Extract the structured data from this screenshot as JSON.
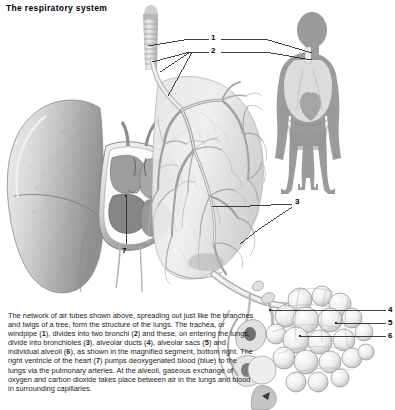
{
  "figure": {
    "title": "The respiratory system",
    "type": "anatomical-illustration",
    "palette": {
      "background": "#ffffff",
      "text": "#111111",
      "leader_line": "#2b2b2b",
      "organ_light": "#f2f2f2",
      "organ_mid": "#c9c9c9",
      "organ_dark": "#8e8e8e",
      "body_silhouette": "#9a9a9a",
      "body_lung": "#d8d8d8"
    }
  },
  "labels": [
    {
      "id": "1",
      "text": "1",
      "refers_to": "trachea-windpipe",
      "x": 214,
      "y": 38
    },
    {
      "id": "2",
      "text": "2",
      "refers_to": "bronchi",
      "x": 214,
      "y": 51
    },
    {
      "id": "3",
      "text": "3",
      "refers_to": "bronchioles",
      "x": 298,
      "y": 202
    },
    {
      "id": "4",
      "text": "4",
      "refers_to": "alveolar-ducts",
      "x": 390,
      "y": 309
    },
    {
      "id": "5",
      "text": "5",
      "refers_to": "alveolar-sacs",
      "x": 390,
      "y": 322
    },
    {
      "id": "6",
      "text": "6",
      "refers_to": "individual-alveoli",
      "x": 390,
      "y": 334
    },
    {
      "id": "7",
      "text": "7",
      "refers_to": "right-ventricle-of-heart",
      "x": 124,
      "y": 251
    }
  ],
  "parts": [
    {
      "name": "left-lung",
      "description": "Left lung, external surface, shaded grey"
    },
    {
      "name": "right-lung-bronchial-tree",
      "description": "Right lung sectioned to reveal branching bronchial tree"
    },
    {
      "name": "trachea",
      "description": "Trachea with cartilage rings at top centre"
    },
    {
      "name": "heart-cross-section",
      "description": "Cut-away of the heart showing chambers and valves"
    },
    {
      "name": "body-silhouette-inset",
      "description": "Grey human figure inset showing lungs in situ"
    },
    {
      "name": "alveoli-cluster",
      "description": "Magnified cluster of alveolar sacs, bottom right"
    }
  ],
  "caption": {
    "segments": [
      {
        "t": "The network of air tubes shown above, spreading out just like the branches and twigs of a tree, form the structure of the lungs. The trachea, or windpipe (",
        "b": false
      },
      {
        "t": "1",
        "b": true
      },
      {
        "t": "), divides into two bronchi (",
        "b": false
      },
      {
        "t": "2",
        "b": true
      },
      {
        "t": ") and these, on entering the lungs, divide into bronchioles (",
        "b": false
      },
      {
        "t": "3",
        "b": true
      },
      {
        "t": "), alveolar ducts (",
        "b": false
      },
      {
        "t": "4",
        "b": true
      },
      {
        "t": "), alveolar sacs (",
        "b": false
      },
      {
        "t": "5",
        "b": true
      },
      {
        "t": ") and individual alveoli (",
        "b": false
      },
      {
        "t": "6",
        "b": true
      },
      {
        "t": "), as shown in the magnified segment, bottom right. The right ventricle of the heart (",
        "b": false
      },
      {
        "t": "7",
        "b": true
      },
      {
        "t": ") pumps deoxygenated blood (blue) to the lungs via the pulmonary arteries. At the alveoli, gaseous exchange of oxygen and carbon dioxide takes place between air in the lungs and blood in surrounding capillaries.",
        "b": false
      }
    ]
  }
}
